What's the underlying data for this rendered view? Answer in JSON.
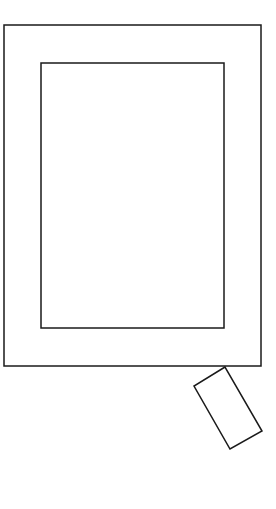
{
  "diagram": {
    "background": "#ffffff",
    "stroke": "#1a1a1a",
    "shapes": [
      {
        "name": "outer-frame",
        "type": "rect",
        "x": 4,
        "y": 25,
        "width": 257,
        "height": 341
      },
      {
        "name": "inner-panel",
        "type": "rect",
        "x": 41,
        "y": 63,
        "width": 183,
        "height": 265
      },
      {
        "name": "tilted-rect",
        "type": "polygon",
        "points": "225,367 194,386 230,449 262,431"
      }
    ]
  }
}
